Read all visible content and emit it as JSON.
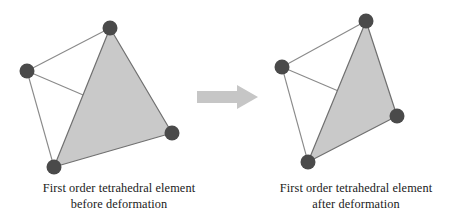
{
  "figure": {
    "name": "first-order-tetrahedral-element-deformation",
    "background_color": "#ffffff",
    "width": 475,
    "height": 224
  },
  "style": {
    "node_color": "#4a4a4a",
    "node_radius": 7.5,
    "face_fill": "#c9c9c9",
    "face_stroke": "#707070",
    "edge_color": "#8a8a8a",
    "edge_width": 1.1,
    "face_stroke_width": 1.2,
    "arrow_color": "#c6c6c6",
    "text_color": "#1a1a1a"
  },
  "arrow": {
    "icon": "right-arrow-icon",
    "direction": "right",
    "color": "#c6c6c6",
    "label": "deforms into"
  },
  "panels": [
    {
      "id": "before",
      "caption_line1": "First order tetrahedral element",
      "caption_line2": "before deformation",
      "nodes": [
        {
          "id": "n-top",
          "label": "top node",
          "x": 110,
          "y": 28
        },
        {
          "id": "n-left",
          "label": "left node",
          "x": 27,
          "y": 71
        },
        {
          "id": "n-bottom",
          "label": "bottom node",
          "x": 54,
          "y": 167
        },
        {
          "id": "n-right",
          "label": "right node",
          "x": 172,
          "y": 133
        }
      ],
      "shaded_face": [
        "n-top",
        "n-bottom",
        "n-right"
      ],
      "back_edges": [
        [
          "n-top",
          "n-left"
        ],
        [
          "n-left",
          "n-bottom"
        ],
        [
          "n-left",
          "n-right"
        ]
      ]
    },
    {
      "id": "after",
      "caption_line1": "First order tetrahedral element",
      "caption_line2": "after deformation",
      "nodes": [
        {
          "id": "n-top",
          "label": "top node",
          "x": 129,
          "y": 21
        },
        {
          "id": "n-left",
          "label": "left node",
          "x": 45,
          "y": 67
        },
        {
          "id": "n-bottom",
          "label": "bottom node",
          "x": 71,
          "y": 162
        },
        {
          "id": "n-right",
          "label": "right node",
          "x": 160,
          "y": 116
        }
      ],
      "shaded_face": [
        "n-top",
        "n-bottom",
        "n-right"
      ],
      "back_edges": [
        [
          "n-top",
          "n-left"
        ],
        [
          "n-left",
          "n-bottom"
        ],
        [
          "n-left",
          "n-right"
        ]
      ]
    }
  ]
}
